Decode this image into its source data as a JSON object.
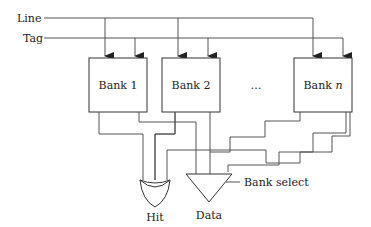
{
  "diagram": {
    "inputs": {
      "line": "Line",
      "tag": "Tag"
    },
    "banks": [
      {
        "label": "Bank 1"
      },
      {
        "label": "Bank 2"
      },
      {
        "label": "Bank ",
        "italic_suffix": "n"
      }
    ],
    "ellipsis": "…",
    "outputs": {
      "hit": "Hit",
      "data": "Data"
    },
    "mux_select": "Bank select",
    "colors": {
      "stroke": "#555555",
      "box": "#333333",
      "text": "#222222"
    }
  }
}
